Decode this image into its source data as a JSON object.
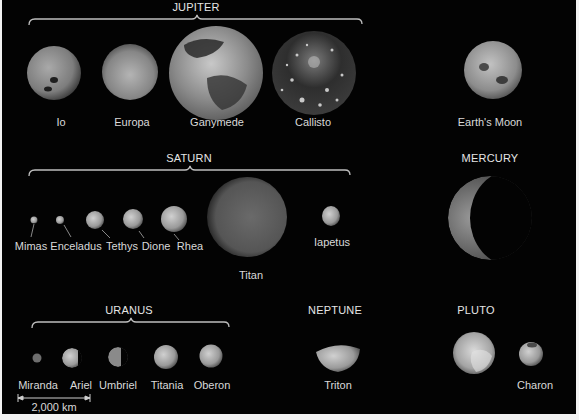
{
  "groups": {
    "jupiter": {
      "title": "JUPITER",
      "moons": [
        "Io",
        "Europa",
        "Ganymede",
        "Callisto"
      ]
    },
    "earth": {
      "moons": [
        "Earth's Moon"
      ]
    },
    "saturn": {
      "title": "SATURN",
      "moons": [
        "Mimas",
        "Enceladus",
        "Tethys",
        "Dione",
        "Rhea",
        "Titan",
        "Iapetus"
      ]
    },
    "mercury": {
      "title": "MERCURY"
    },
    "uranus": {
      "title": "URANUS",
      "moons": [
        "Miranda",
        "Ariel",
        "Umbriel",
        "Titania",
        "Oberon"
      ]
    },
    "neptune": {
      "title": "NEPTUNE",
      "moons": [
        "Triton"
      ]
    },
    "pluto": {
      "title": "PLUTO",
      "moons": [
        "Pluto",
        "Charon"
      ]
    }
  },
  "scale_bar": {
    "label": "2,000 km"
  },
  "colors": {
    "background": "#030303",
    "text": "#d9d9d9",
    "bracket": "#bfbfbf",
    "border": "#f2f2f2"
  }
}
